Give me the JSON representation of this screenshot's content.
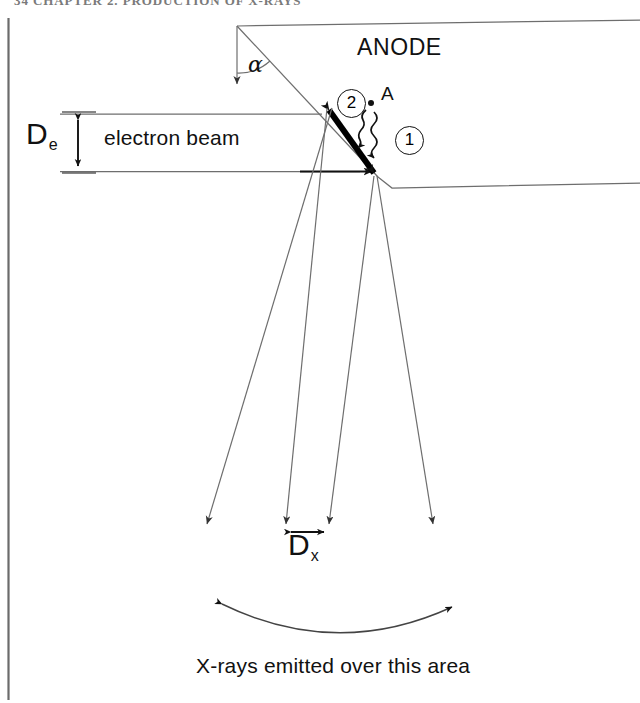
{
  "page": {
    "width": 640,
    "height": 703,
    "background": "#ffffff",
    "ink": "#111111",
    "line_color": "#555555",
    "running_head": "34    CHAPTER 2. PRODUCTION OF X-RAYS"
  },
  "figure": {
    "labels": {
      "anode": "ANODE",
      "electron_beam": "electron beam",
      "emission_area": "X-rays emitted over this area",
      "interaction_point": "A",
      "target_angle": "α",
      "electron_beam_width_symbol": "D",
      "electron_beam_width_subscript": "e",
      "xray_focal_spot_symbol": "D",
      "xray_focal_spot_subscript": "x",
      "marker_one": "1",
      "marker_two": "2"
    },
    "geometry": {
      "apex": [
        237,
        26
      ],
      "focal_track_start": [
        325,
        106
      ],
      "focal_track_end": [
        378,
        177
      ],
      "beam_top_y": 114,
      "beam_bottom_y": 171,
      "beam_left_x": 88,
      "point_A": [
        371,
        103
      ],
      "ray_bottom_y": 530,
      "inner_ray_left_x": 285,
      "inner_ray_right_x": 328,
      "outer_ray_left_x": 206,
      "outer_ray_right_x": 432,
      "arc_left_x": 218,
      "arc_right_x": 455,
      "arc_dip_y": 629,
      "page_rule_x": 8
    }
  }
}
